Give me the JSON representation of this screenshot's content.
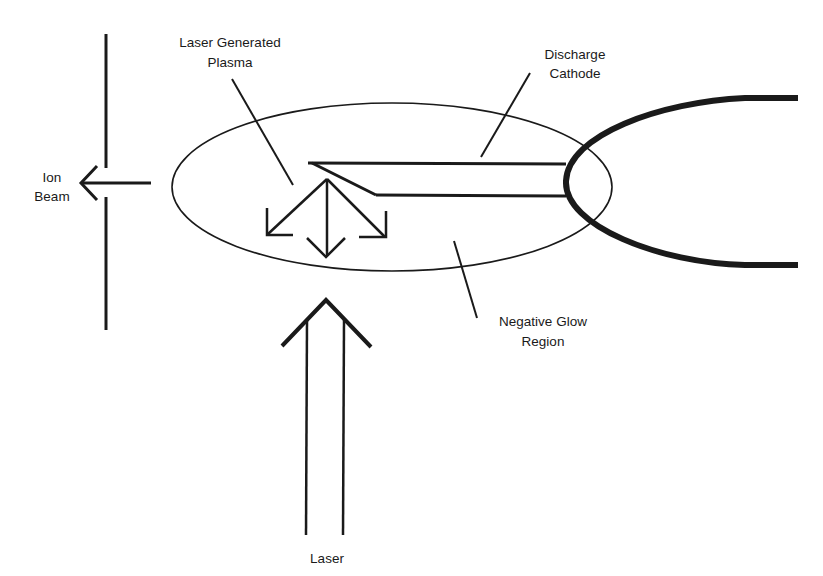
{
  "diagram": {
    "type": "schematic",
    "labels": {
      "plasma": [
        "Laser Generated",
        "Plasma"
      ],
      "cathode": [
        "Discharge",
        "Cathode"
      ],
      "ion_beam": [
        "Ion",
        "Beam"
      ],
      "glow": [
        "Negative Glow",
        "Region"
      ],
      "laser": "Laser"
    },
    "line_color": "#1a1a1a"
  }
}
